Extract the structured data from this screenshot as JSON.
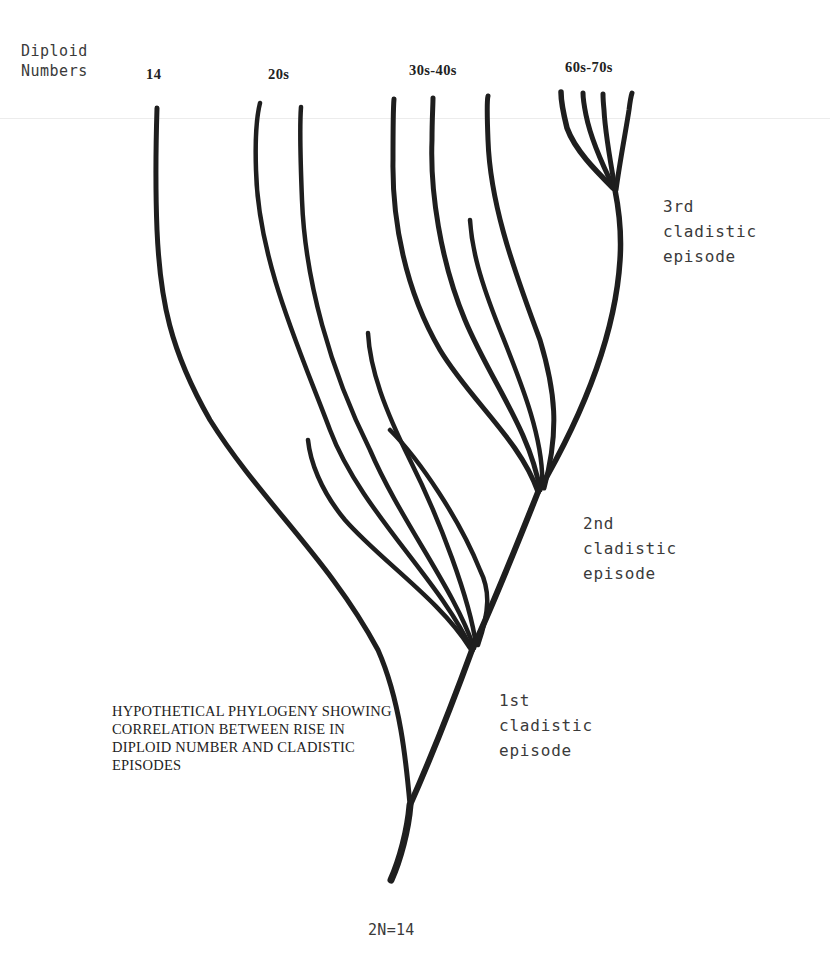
{
  "diagram": {
    "type": "phylogenetic-tree",
    "axis_title": "Diploid\nNumbers",
    "columns": [
      {
        "label": "14",
        "x": 155
      },
      {
        "label": "20s",
        "x": 282
      },
      {
        "label": "30s-40s",
        "x": 442
      },
      {
        "label": "60s-70s",
        "x": 596
      }
    ],
    "episodes": [
      {
        "label": "3rd cladistic\nepisode",
        "node": [
          615,
          190
        ]
      },
      {
        "label": "2nd cladistic\nepisode",
        "node": [
          538,
          492
        ]
      },
      {
        "label": "1st cladistic\nepisode",
        "node": [
          472,
          648
        ]
      }
    ],
    "caption": "HYPOTHETICAL PHYLOGENY SHOWING\nCORRELATION BETWEEN RISE IN\nDIPLOID NUMBER AND CLADISTIC\nEPISODES",
    "root_label": "2N=14",
    "stroke_color": "#1e1e1e"
  }
}
